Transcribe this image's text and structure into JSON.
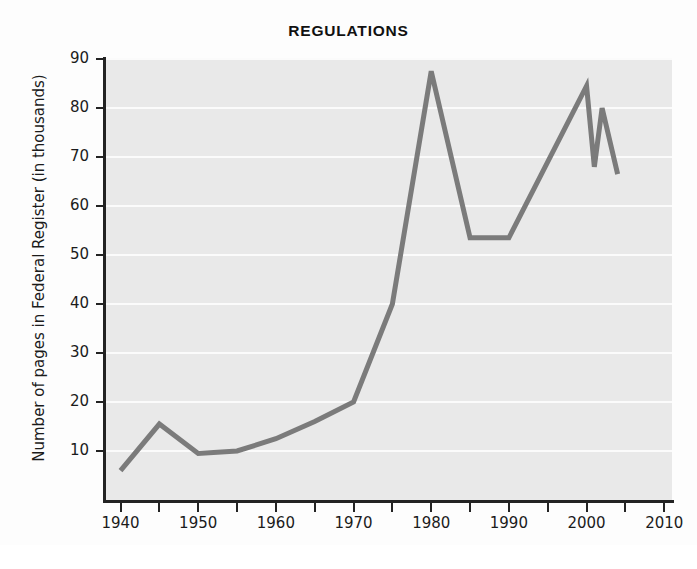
{
  "chart_data": {
    "type": "line",
    "title": "REGULATIONS",
    "xlabel": "",
    "ylabel": "Number of pages in Federal Register (in thousands)",
    "xlim": [
      1938,
      2011
    ],
    "ylim": [
      0,
      90
    ],
    "xticks": [
      1940,
      1950,
      1960,
      1970,
      1980,
      1990,
      2000,
      2010
    ],
    "xtick_labels": [
      "1940",
      "1950",
      "1960",
      "1970",
      "1980",
      "1990",
      "2000",
      "2010"
    ],
    "xminorticks": [
      1945,
      1955,
      1965,
      1975,
      1985,
      1995,
      2005
    ],
    "yticks": [
      10,
      20,
      30,
      40,
      50,
      60,
      70,
      80,
      90
    ],
    "ytick_labels": [
      "10",
      "20",
      "30",
      "40",
      "50",
      "60",
      "70",
      "80",
      "90"
    ],
    "grid": "horizontal-white",
    "legend": "none",
    "series": [
      {
        "name": "Pages in Federal Register",
        "color": "#7b7b7b",
        "x": [
          1940,
          1945,
          1950,
          1955,
          1960,
          1965,
          1970,
          1975,
          1980,
          1985,
          1990,
          2000,
          2001,
          2002,
          2004
        ],
        "values": [
          6.0,
          15.5,
          9.5,
          10.0,
          12.5,
          16.0,
          20.0,
          40.0,
          87.5,
          53.5,
          53.5,
          84.5,
          68.0,
          80.0,
          66.5
        ]
      }
    ]
  },
  "figure": {
    "title": "REGULATIONS",
    "y_axis_title": "Number of pages in Federal Register (in thousands)",
    "line_color": "#7b7b7b",
    "plot_background": "#e9e9e9",
    "grid_color": "#fbfbfb",
    "axis_color": "#232323"
  }
}
